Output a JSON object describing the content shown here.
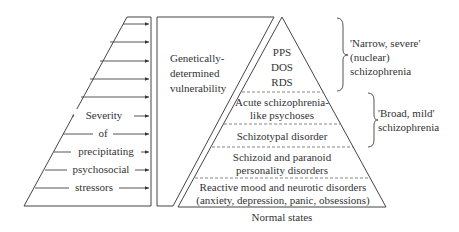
{
  "diagram": {
    "stressor_panel": {
      "label_lines": [
        "Severity",
        "of",
        "precipitating",
        "psychosocial",
        "stressors"
      ],
      "arrow_count": 10
    },
    "vulnerability_panel": {
      "label_lines": [
        "Genetically-",
        "determined",
        "vulnerability"
      ]
    },
    "pyramid": {
      "tiers": [
        {
          "lines": [
            "PPS",
            "DOS",
            "RDS"
          ]
        },
        {
          "lines": [
            "Acute schizophrenia-",
            "like psychoses"
          ]
        },
        {
          "lines": [
            "Schizotypal disorder"
          ]
        },
        {
          "lines": [
            "Schizoid and paranoid",
            "personality disorders"
          ]
        },
        {
          "lines": [
            "Reactive mood and neurotic disorders",
            "(anxiety, depression, panic, obsessions)"
          ]
        }
      ],
      "base_label": "Normal states"
    },
    "brackets": [
      {
        "lines": [
          "'Narrow, severe'",
          "(nuclear)",
          "schizophrenia"
        ]
      },
      {
        "lines": [
          "'Broad, mild'",
          "schizophrenia"
        ]
      }
    ]
  }
}
